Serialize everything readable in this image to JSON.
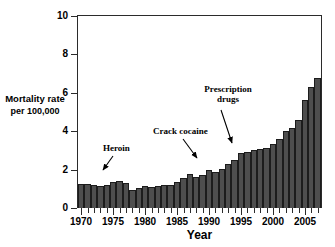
{
  "chart_data": {
    "type": "bar",
    "title": "",
    "xlabel": "Year",
    "ylabel": "Mortality rate per 100,000",
    "ylabel_line1": "Mortality rate",
    "ylabel_line2": "per 100,000",
    "ylim": [
      0,
      10
    ],
    "ytick_values": [
      0,
      2,
      4,
      6,
      8,
      10
    ],
    "ytick_labels": [
      "0",
      "2",
      "4",
      "6",
      "8",
      "10"
    ],
    "xlim": [
      1969.5,
      2007.5
    ],
    "xtick_labels": [
      "1970",
      "1975",
      "1980",
      "1985",
      "1990",
      "1995",
      "2000",
      "2005"
    ],
    "xtick_label_years": [
      1970,
      1975,
      1980,
      1985,
      1990,
      1995,
      2000,
      2005
    ],
    "grid": false,
    "legend": "none",
    "bar_color": "#4e4e4e",
    "bar_edge_color": "#1c1c1c",
    "axis_color": "#2b2b2b",
    "categories": [
      "1970",
      "1971",
      "1972",
      "1973",
      "1974",
      "1975",
      "1976",
      "1977",
      "1978",
      "1979",
      "1980",
      "1981",
      "1982",
      "1983",
      "1984",
      "1985",
      "1986",
      "1987",
      "1988",
      "1989",
      "1990",
      "1991",
      "1992",
      "1993",
      "1994",
      "1995",
      "1996",
      "1997",
      "1998",
      "1999",
      "2000",
      "2001",
      "2002",
      "2003",
      "2004",
      "2005",
      "2006",
      "2007"
    ],
    "values": [
      1.25,
      1.25,
      1.2,
      1.15,
      1.2,
      1.35,
      1.4,
      1.3,
      0.95,
      1.05,
      1.15,
      1.1,
      1.15,
      1.2,
      1.2,
      1.35,
      1.55,
      1.75,
      1.6,
      1.7,
      2.0,
      1.85,
      2.05,
      2.3,
      2.5,
      2.85,
      2.9,
      3.0,
      3.05,
      3.15,
      3.35,
      3.6,
      4.0,
      4.15,
      4.6,
      5.65,
      6.3,
      6.75
    ],
    "annotations": [
      {
        "name": "heroin",
        "text": "Heroin",
        "pointing_to_year": 1973,
        "pointing_to_value": 1.2
      },
      {
        "name": "crack-cocaine",
        "text": "Crack cocaine",
        "pointing_to_year": 1989,
        "pointing_to_value": 2.0
      },
      {
        "name": "prescription-drugs",
        "text": "Prescription drugs",
        "line1": "Prescription",
        "line2": "drugs",
        "pointing_to_year": 1995,
        "pointing_to_value": 3.4
      }
    ]
  }
}
